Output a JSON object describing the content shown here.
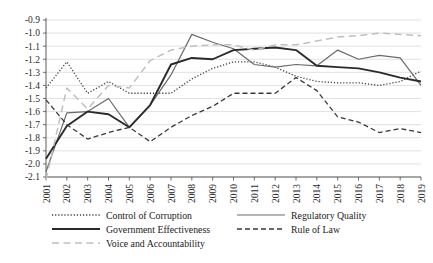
{
  "chart_data": {
    "type": "line",
    "title": "",
    "subtitle": "",
    "xlabel": "",
    "ylabel": "",
    "grid": true,
    "legend_position": "bottom",
    "ylim": [
      -2.15,
      -0.85
    ],
    "yticks": [
      "-0.9",
      "-1.0",
      "-1.1",
      "-1.2",
      "-1.3",
      "-1.4",
      "-1.5",
      "-1.6",
      "-1.7",
      "-1.8",
      "-1.9",
      "-2.0",
      "-2.1"
    ],
    "ytick_values": [
      -0.9,
      -1.0,
      -1.1,
      -1.2,
      -1.3,
      -1.4,
      -1.5,
      -1.6,
      -1.7,
      -1.8,
      -1.9,
      -2.0,
      -2.1
    ],
    "categories": [
      "2001",
      "2002",
      "2003",
      "2004",
      "2005",
      "2006",
      "2007",
      "2008",
      "2009",
      "2010",
      "2011",
      "2012",
      "2013",
      "2014",
      "2015",
      "2016",
      "2017",
      "2018",
      "2019"
    ],
    "x": [
      2001,
      2002,
      2003,
      2004,
      2005,
      2006,
      2007,
      2008,
      2009,
      2010,
      2011,
      2012,
      2013,
      2014,
      2015,
      2016,
      2017,
      2018,
      2019
    ],
    "series": [
      {
        "name": "Control of Corruption",
        "style": "dotted",
        "color": "#3d3d3d",
        "width": 1.3,
        "values": [
          -1.42,
          -1.22,
          -1.46,
          -1.37,
          -1.46,
          -1.46,
          -1.46,
          -1.35,
          -1.27,
          -1.22,
          -1.22,
          -1.26,
          -1.33,
          -1.37,
          -1.38,
          -1.38,
          -1.4,
          -1.37,
          -1.29
        ]
      },
      {
        "name": "Regulatory Quality",
        "style": "solid-thin",
        "color": "#6b6b6b",
        "width": 1.2,
        "values": [
          -2.06,
          -1.61,
          -1.6,
          -1.5,
          -1.72,
          -1.55,
          -1.32,
          -1.01,
          -1.07,
          -1.12,
          -1.24,
          -1.26,
          -1.24,
          -1.25,
          -1.13,
          -1.2,
          -1.17,
          -1.19,
          -1.4
        ]
      },
      {
        "name": "Government Effectiveness",
        "style": "solid-thick",
        "color": "#2a2a2a",
        "width": 1.9,
        "values": [
          -1.96,
          -1.71,
          -1.6,
          -1.62,
          -1.72,
          -1.55,
          -1.24,
          -1.19,
          -1.2,
          -1.13,
          -1.12,
          -1.11,
          -1.13,
          -1.25,
          -1.26,
          -1.27,
          -1.3,
          -1.34,
          -1.37
        ]
      },
      {
        "name": "Rule of Law",
        "style": "dashed",
        "color": "#3a3a3a",
        "width": 1.3,
        "values": [
          -1.51,
          -1.7,
          -1.81,
          -1.76,
          -1.72,
          -1.83,
          -1.72,
          -1.63,
          -1.56,
          -1.46,
          -1.46,
          -1.46,
          -1.34,
          -1.44,
          -1.64,
          -1.68,
          -1.76,
          -1.73,
          -1.76
        ]
      },
      {
        "name": "Voice and Accountability",
        "style": "longdash",
        "color": "#bfbfbf",
        "width": 1.5,
        "values": [
          -2.12,
          -1.42,
          -1.58,
          -1.4,
          -1.42,
          -1.21,
          -1.13,
          -1.1,
          -1.09,
          -1.09,
          -1.13,
          -1.09,
          -1.09,
          -1.06,
          -1.03,
          -1.02,
          -1.0,
          -1.01,
          -1.02
        ]
      }
    ],
    "legend": [
      {
        "label": "Control of Corruption",
        "style": "dotted",
        "color": "#3d3d3d"
      },
      {
        "label": "Regulatory Quality",
        "style": "solid-thin",
        "color": "#6b6b6b"
      },
      {
        "label": "Government Effectiveness",
        "style": "solid-thick",
        "color": "#2a2a2a"
      },
      {
        "label": "Rule of Law",
        "style": "dashed",
        "color": "#3a3a3a"
      },
      {
        "label": "Voice and Accountability",
        "style": "longdash",
        "color": "#bfbfbf"
      }
    ]
  },
  "legend_items": {
    "item0": "Control of Corruption",
    "item1": "Regulatory Quality",
    "item2": "Government Effectiveness",
    "item3": "Rule of Law",
    "item4": "Voice and Accountability"
  }
}
